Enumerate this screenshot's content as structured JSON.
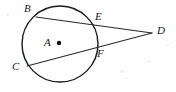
{
  "figure": {
    "width": 176,
    "height": 92,
    "background_color": "#fefefe",
    "stroke_color": "#1a1a1a",
    "label_color": "#1a1a1a"
  },
  "circle": {
    "name": "circle-A",
    "center_label": "A",
    "center_x": 60,
    "center_y": 44,
    "radius": 38,
    "stroke_width": 1.4
  },
  "center_dot": {
    "x": 59,
    "y": 43,
    "radius": 2.2
  },
  "points": {
    "A": {
      "label": "A",
      "x": 59,
      "y": 43,
      "label_x": 44,
      "label_y": 37,
      "on_circle": false
    },
    "B": {
      "label": "B",
      "x": 36,
      "y": 17,
      "label_x": 24,
      "label_y": 3,
      "on_circle": true
    },
    "C": {
      "label": "C",
      "x": 27,
      "y": 66,
      "label_x": 12,
      "label_y": 61,
      "on_circle": true
    },
    "D": {
      "label": "D",
      "x": 152,
      "y": 33,
      "label_x": 157,
      "label_y": 25,
      "on_circle": false
    },
    "E": {
      "label": "E",
      "x": 92,
      "y": 22,
      "label_x": 95,
      "label_y": 11,
      "on_circle": true
    },
    "F": {
      "label": "F",
      "x": 93,
      "y": 51,
      "label_x": 97,
      "label_y": 48,
      "on_circle": true
    }
  },
  "segments": [
    {
      "name": "secant-BD",
      "from": "B",
      "to": "D",
      "through": "E",
      "x1": 36,
      "y1": 17,
      "x2": 152,
      "y2": 33
    },
    {
      "name": "secant-CD",
      "from": "C",
      "to": "D",
      "through": "F",
      "x1": 27,
      "y1": 66,
      "x2": 152,
      "y2": 33
    }
  ],
  "labels_order": [
    "B",
    "E",
    "D",
    "A",
    "C",
    "F"
  ]
}
